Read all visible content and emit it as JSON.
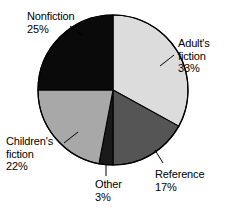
{
  "chart_data": {
    "type": "pie",
    "title": "",
    "subtitle": "",
    "xlabel": "",
    "ylabel": "",
    "legend_position": "none",
    "data_labels": true,
    "units": "percent",
    "total": 100,
    "start_angle_deg": 0,
    "direction": "clockwise",
    "categories": [
      "Adult's fiction",
      "Reference",
      "Other",
      "Children's fiction",
      "Nonfiction"
    ],
    "values": [
      33,
      17,
      3,
      22,
      25
    ],
    "slices": [
      {
        "name": "adults-fiction",
        "label_line1": "Adult's",
        "label_line2": "fiction",
        "value_text": "33%",
        "value": 33,
        "color": "#dcdcdc",
        "start_deg": 0,
        "end_deg": 118.8
      },
      {
        "name": "reference",
        "label_line1": "Reference",
        "label_line2": "",
        "value_text": "17%",
        "value": 17,
        "color": "#555555",
        "start_deg": 118.8,
        "end_deg": 180.0
      },
      {
        "name": "other",
        "label_line1": "Other",
        "label_line2": "",
        "value_text": "3%",
        "value": 3,
        "color": "#1a1a1a",
        "start_deg": 180.0,
        "end_deg": 190.8
      },
      {
        "name": "childrens-fiction",
        "label_line1": "Children's",
        "label_line2": "fiction",
        "value_text": "22%",
        "value": 22,
        "color": "#a8a8a8",
        "start_deg": 190.8,
        "end_deg": 270.0
      },
      {
        "name": "nonfiction",
        "label_line1": "Nonfiction",
        "label_line2": "",
        "value_text": "25%",
        "value": 25,
        "color": "#0a0a0a",
        "start_deg": 270.0,
        "end_deg": 360.0
      }
    ],
    "geometry": {
      "center_x": 113,
      "center_y": 90,
      "radius": 75
    },
    "colors": {
      "adults_fiction": "#dcdcdc",
      "reference": "#555555",
      "other": "#1a1a1a",
      "childrens_fiction": "#a8a8a8",
      "nonfiction": "#0a0a0a",
      "outline": "#000000",
      "text": "#000000",
      "background": "#ffffff"
    }
  }
}
